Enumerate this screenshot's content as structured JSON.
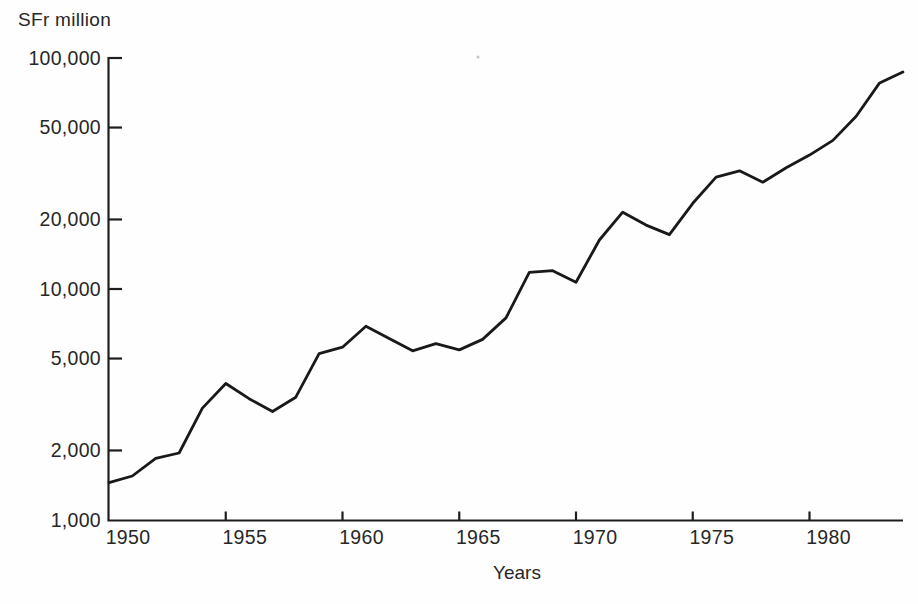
{
  "chart_data": {
    "type": "line",
    "title": "",
    "ylabel": "SFr million",
    "xlabel": "Years",
    "y_scale": "log",
    "ylim": [
      1000,
      100000
    ],
    "xlim": [
      1950,
      1984
    ],
    "grid": false,
    "legend": false,
    "line_color": "#191919",
    "axis_color": "#1e1e1e",
    "background": "#fefefe",
    "years": [
      1950,
      1951,
      1952,
      1953,
      1954,
      1955,
      1956,
      1957,
      1958,
      1959,
      1960,
      1961,
      1962,
      1963,
      1964,
      1965,
      1966,
      1967,
      1968,
      1969,
      1970,
      1971,
      1972,
      1973,
      1974,
      1975,
      1976,
      1977,
      1978,
      1979,
      1980,
      1981,
      1982,
      1983,
      1984
    ],
    "values": [
      1450,
      1550,
      1850,
      1950,
      3050,
      3900,
      3350,
      2950,
      3400,
      5250,
      5600,
      6900,
      6100,
      5400,
      5800,
      5450,
      6050,
      7500,
      11800,
      12000,
      10700,
      16300,
      21500,
      18900,
      17200,
      23500,
      30500,
      32500,
      29000,
      33500,
      38000,
      44000,
      56000,
      78000,
      87000
    ],
    "y_ticks": [
      {
        "value": 1000,
        "label": "1,000"
      },
      {
        "value": 2000,
        "label": "2,000"
      },
      {
        "value": 5000,
        "label": "5,000"
      },
      {
        "value": 10000,
        "label": "10,000"
      },
      {
        "value": 20000,
        "label": "20,000"
      },
      {
        "value": 50000,
        "label": "50,000"
      },
      {
        "value": 100000,
        "label": "100,000"
      }
    ],
    "x_ticks": [
      {
        "year": 1950,
        "label": "1950",
        "mark": false
      },
      {
        "year": 1955,
        "label": "1955",
        "mark": true
      },
      {
        "year": 1960,
        "label": "1960",
        "mark": true
      },
      {
        "year": 1965,
        "label": "1965",
        "mark": true
      },
      {
        "year": 1970,
        "label": "1970",
        "mark": true
      },
      {
        "year": 1975,
        "label": "1975",
        "mark": true
      },
      {
        "year": 1980,
        "label": "1980",
        "mark": true
      }
    ]
  }
}
